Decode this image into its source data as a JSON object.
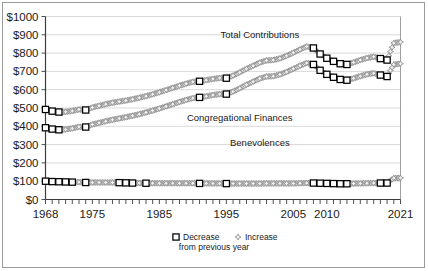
{
  "chart_data": {
    "type": "line",
    "title": "",
    "subtitle": "",
    "xlabel": "",
    "ylabel": "",
    "xlim": [
      1968,
      2021
    ],
    "ylim": [
      0,
      1000
    ],
    "grid": true,
    "legend_position": "bottom",
    "y_ticks": [
      "$0",
      "$100",
      "$200",
      "$300",
      "$400",
      "$500",
      "$600",
      "$700",
      "$800",
      "$900",
      "$1000"
    ],
    "y_tick_values": [
      0,
      100,
      200,
      300,
      400,
      500,
      600,
      700,
      800,
      900,
      1000
    ],
    "x_ticks": [
      "1968",
      "1975",
      "1985",
      "1995",
      "2005",
      "2010",
      "2021"
    ],
    "x_tick_values": [
      1968,
      1975,
      1985,
      1995,
      2005,
      2010,
      2021
    ],
    "annotations": [
      {
        "text": "Total Contributions",
        "x": 2000,
        "y": 880
      },
      {
        "text": "Congregational Finances",
        "x": 1997,
        "y": 430
      },
      {
        "text": "Benevolences",
        "x": 2000,
        "y": 290
      }
    ],
    "x": [
      1968,
      1969,
      1970,
      1971,
      1972,
      1973,
      1974,
      1975,
      1976,
      1977,
      1978,
      1979,
      1980,
      1981,
      1982,
      1983,
      1984,
      1985,
      1986,
      1987,
      1988,
      1989,
      1990,
      1991,
      1992,
      1993,
      1994,
      1995,
      1996,
      1997,
      1998,
      1999,
      2000,
      2001,
      2002,
      2003,
      2004,
      2005,
      2006,
      2007,
      2008,
      2009,
      2010,
      2011,
      2012,
      2013,
      2014,
      2015,
      2016,
      2017,
      2018,
      2019,
      2020,
      2021
    ],
    "series": [
      {
        "name": "Total Contributions",
        "values": [
          492,
          483,
          478,
          479,
          484,
          492,
          489,
          503,
          512,
          521,
          529,
          535,
          541,
          548,
          556,
          565,
          575,
          586,
          598,
          610,
          622,
          633,
          643,
          646,
          652,
          659,
          664,
          663,
          677,
          695,
          714,
          731,
          748,
          760,
          762,
          771,
          785,
          802,
          820,
          836,
          828,
          795,
          772,
          755,
          742,
          738,
          749,
          762,
          773,
          780,
          770,
          762,
          855,
          860
        ],
        "markers": [
          "decrease",
          "decrease",
          "decrease",
          "increase",
          "increase",
          "increase",
          "decrease",
          "increase",
          "increase",
          "increase",
          "increase",
          "increase",
          "increase",
          "increase",
          "increase",
          "increase",
          "increase",
          "increase",
          "increase",
          "increase",
          "increase",
          "increase",
          "increase",
          "decrease",
          "increase",
          "increase",
          "increase",
          "decrease",
          "increase",
          "increase",
          "increase",
          "increase",
          "increase",
          "increase",
          "increase",
          "increase",
          "increase",
          "increase",
          "increase",
          "increase",
          "decrease",
          "decrease",
          "decrease",
          "decrease",
          "decrease",
          "decrease",
          "increase",
          "increase",
          "increase",
          "increase",
          "decrease",
          "decrease",
          "increase",
          "increase"
        ]
      },
      {
        "name": "Congregational Finances",
        "values": [
          392,
          385,
          381,
          383,
          389,
          397,
          396,
          410,
          419,
          428,
          436,
          443,
          450,
          458,
          466,
          476,
          486,
          497,
          509,
          521,
          533,
          544,
          554,
          558,
          564,
          571,
          576,
          576,
          590,
          608,
          627,
          644,
          661,
          672,
          674,
          683,
          697,
          714,
          731,
          746,
          738,
          706,
          684,
          668,
          656,
          652,
          662,
          674,
          684,
          690,
          680,
          672,
          738,
          742
        ],
        "markers": [
          "decrease",
          "decrease",
          "decrease",
          "increase",
          "increase",
          "increase",
          "decrease",
          "increase",
          "increase",
          "increase",
          "increase",
          "increase",
          "increase",
          "increase",
          "increase",
          "increase",
          "increase",
          "increase",
          "increase",
          "increase",
          "increase",
          "increase",
          "increase",
          "decrease",
          "increase",
          "increase",
          "increase",
          "decrease",
          "increase",
          "increase",
          "increase",
          "increase",
          "increase",
          "increase",
          "increase",
          "increase",
          "increase",
          "increase",
          "increase",
          "increase",
          "decrease",
          "decrease",
          "decrease",
          "decrease",
          "decrease",
          "decrease",
          "increase",
          "increase",
          "increase",
          "increase",
          "decrease",
          "decrease",
          "increase",
          "increase"
        ]
      },
      {
        "name": "Benevolences",
        "values": [
          100,
          98,
          97,
          96,
          95,
          95,
          93,
          93,
          93,
          93,
          93,
          92,
          91,
          90,
          90,
          89,
          89,
          89,
          89,
          89,
          89,
          89,
          89,
          88,
          88,
          88,
          88,
          87,
          87,
          87,
          87,
          87,
          87,
          88,
          88,
          88,
          88,
          88,
          89,
          90,
          90,
          89,
          88,
          87,
          86,
          86,
          87,
          88,
          89,
          90,
          90,
          90,
          117,
          118
        ],
        "markers": [
          "decrease",
          "decrease",
          "decrease",
          "decrease",
          "decrease",
          "increase",
          "decrease",
          "increase",
          "increase",
          "increase",
          "increase",
          "decrease",
          "decrease",
          "decrease",
          "increase",
          "decrease",
          "increase",
          "increase",
          "increase",
          "increase",
          "increase",
          "increase",
          "increase",
          "decrease",
          "increase",
          "increase",
          "increase",
          "decrease",
          "increase",
          "increase",
          "increase",
          "increase",
          "increase",
          "increase",
          "increase",
          "increase",
          "increase",
          "increase",
          "increase",
          "increase",
          "decrease",
          "decrease",
          "decrease",
          "decrease",
          "decrease",
          "decrease",
          "increase",
          "increase",
          "increase",
          "increase",
          "decrease",
          "decrease",
          "increase",
          "increase"
        ]
      }
    ],
    "legend": [
      {
        "marker": "decrease",
        "label": "Decrease"
      },
      {
        "marker": "increase",
        "label": "Increase"
      }
    ],
    "legend_note": "from previous year"
  },
  "colors": {
    "background": "#ffffff",
    "axis": "#3c3c3c",
    "grid": "#c8c8c8",
    "decrease_marker": "#000000",
    "increase_marker": "#8c8c8c",
    "frame": "#9a9a9a"
  }
}
